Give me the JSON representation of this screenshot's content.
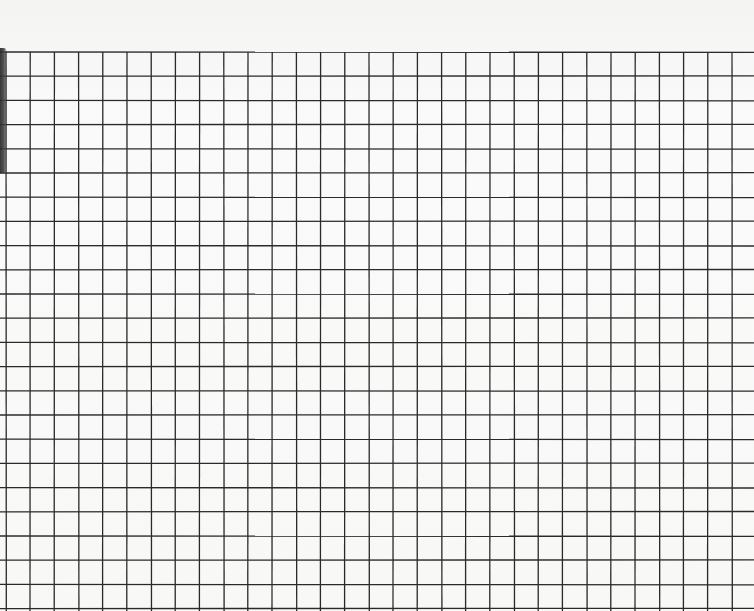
{
  "scene": {
    "description": "Photograph of a sheet of square-grid graph paper",
    "paper_color": "#f7f7f6",
    "line_color": "#2a2a2a",
    "grid": {
      "origin_x": 6,
      "origin_y": 52,
      "cell_size": 24.2,
      "columns": 31,
      "rows": 23
    },
    "shadow": {
      "edge": "left",
      "top": 48,
      "height": 125
    }
  }
}
